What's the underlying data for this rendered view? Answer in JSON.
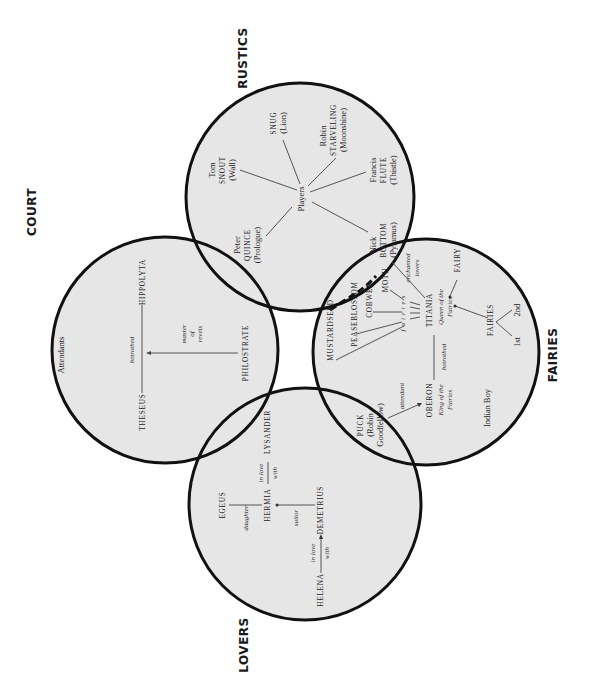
{
  "diagram": {
    "colors": {
      "circle_fill": "#e6e6e6",
      "circle_stroke": "#111111",
      "background": "#ffffff",
      "text": "#222222"
    },
    "orientation": "rotated 90 degrees counter-clockwise (text reads bottom-to-top)",
    "groups": [
      {
        "id": "rustics",
        "title": "RUSTICS",
        "cx": 300,
        "cy": 197,
        "r": 114
      },
      {
        "id": "court",
        "title": "COURT",
        "cx": 165,
        "cy": 350,
        "r": 113
      },
      {
        "id": "lovers",
        "title": "LOVERS",
        "cx": 305,
        "cy": 504,
        "r": 116
      },
      {
        "id": "fairies",
        "title": "FAIRIES",
        "cx": 426,
        "cy": 352,
        "r": 113
      }
    ]
  },
  "rustics": {
    "title": "RUSTICS",
    "hub": "Players",
    "members": [
      {
        "first": "Tom",
        "name": "SNOUT",
        "role": "(Wall)"
      },
      {
        "first": "",
        "name": "SNUG",
        "role": "(Lion)"
      },
      {
        "first": "Robin",
        "name": "STARVELING",
        "role": "(Moonshine)"
      },
      {
        "first": "Francis",
        "name": "FLUTE",
        "role": "(Thistle)"
      },
      {
        "first": "Nick",
        "name": "BOTTOM",
        "role": "(Pyramus)"
      },
      {
        "first": "Peter",
        "name": "QUINCE",
        "role": "(Prologue)"
      }
    ]
  },
  "court": {
    "title": "COURT",
    "attendants": "Attendants",
    "theseus": "THESEUS",
    "hippolyta": "HIPPOLYTA",
    "betrothed": "betrothed",
    "philostrate": "PHILOSTRATE",
    "master_of_revels": [
      "master",
      "of",
      "revels"
    ]
  },
  "lovers": {
    "title": "LOVERS",
    "egeus": "EGEUS",
    "daughter": "daughter",
    "hermia": "HERMIA",
    "in_love": "in love",
    "with": "with",
    "lysander": "LYSANDER",
    "suitor": "suitor",
    "demetrius": "DEMETRIUS",
    "helena": "HELENA"
  },
  "fairies": {
    "title": "FAIRIES",
    "attendants": [
      "MUSTARDSEED",
      "PEASEBLOSSOM",
      "COBWEB",
      "MOTH"
    ],
    "fairies_label": "fairies",
    "titania": "TITANIA",
    "titania_title": [
      "Queen of the",
      "Fairies"
    ],
    "enchanted_lovers": [
      "enchanted",
      "lovers"
    ],
    "fairy": "FAIRY",
    "fairies_group": "FAIRIES",
    "first": "1st",
    "second": "2nd",
    "betrothed": "betrothed",
    "oberon": "OBERON",
    "oberon_title": [
      "King of the",
      "Fairies"
    ],
    "attendant": "attendant",
    "puck": [
      "PUCK",
      "(Robin",
      "Goodfellow)"
    ],
    "indian_boy": "Indian Boy"
  }
}
